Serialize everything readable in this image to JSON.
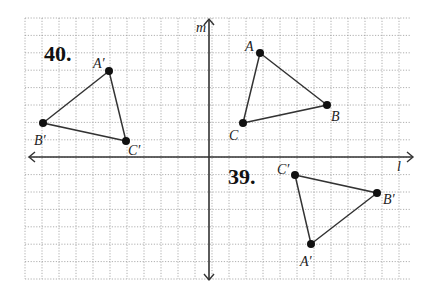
{
  "figure": {
    "grid": {
      "x0": 25,
      "y0": 18,
      "x1": 410,
      "y1": 279,
      "spacing_x": 17.0,
      "spacing_y": 17.4,
      "color": "#9a9a9a"
    },
    "axes": {
      "origin": {
        "x": 209,
        "y": 157
      },
      "horizontal_label": "l",
      "vertical_label": "m",
      "color": "#333333"
    },
    "problems": [
      {
        "number": "39.",
        "triangles": [
          {
            "name": "triangle-ABC",
            "vertices": [
              {
                "label": "A",
                "x": 260,
                "y": 53,
                "lx": 245,
                "ly": 51
              },
              {
                "label": "B",
                "x": 327,
                "y": 105,
                "lx": 331,
                "ly": 121
              },
              {
                "label": "C",
                "x": 243,
                "y": 123,
                "lx": 229,
                "ly": 140
              }
            ]
          },
          {
            "name": "triangle-A'B'C'-39",
            "vertices": [
              {
                "label": "A′",
                "x": 311,
                "y": 244,
                "lx": 300,
                "ly": 266
              },
              {
                "label": "B′",
                "x": 377,
                "y": 193,
                "lx": 383,
                "ly": 204
              },
              {
                "label": "C′",
                "x": 295,
                "y": 175,
                "lx": 277,
                "ly": 174
              }
            ]
          }
        ],
        "pos": {
          "x": 228,
          "y": 184
        }
      },
      {
        "number": "40.",
        "triangles": [
          {
            "name": "triangle-A'B'C'-40",
            "vertices": [
              {
                "label": "A′",
                "x": 109,
                "y": 71,
                "lx": 93,
                "ly": 68
              },
              {
                "label": "B′",
                "x": 43,
                "y": 123,
                "lx": 34,
                "ly": 145
              },
              {
                "label": "C′",
                "x": 126,
                "y": 141,
                "lx": 128,
                "ly": 155
              }
            ]
          }
        ],
        "pos": {
          "x": 44,
          "y": 61
        }
      }
    ],
    "line_color": "#333333",
    "point_color": "#111111"
  }
}
